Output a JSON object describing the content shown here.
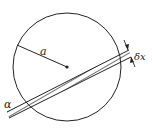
{
  "diagram": {
    "labels": {
      "radius": "a",
      "angle": "α",
      "width": "δx"
    },
    "circle": {
      "cx": 67,
      "cy": 67,
      "r": 54
    },
    "colors": {
      "stroke": "#222222",
      "background": "#ffffff"
    }
  }
}
